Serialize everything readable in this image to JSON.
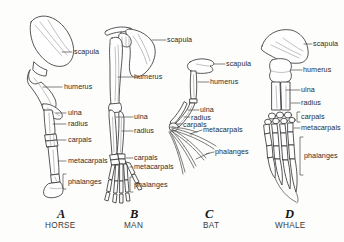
{
  "figure": {
    "background_color": "#fdfdfc",
    "ink_color": "#3a3a3a"
  },
  "panels": [
    {
      "letter": "A",
      "name": "HORSE",
      "labels": [
        {
          "key": "scapula",
          "text": "scapula"
        },
        {
          "key": "humerus",
          "text": "humerus"
        },
        {
          "key": "ulna",
          "text": "ulna"
        },
        {
          "key": "radius",
          "text": "radius"
        },
        {
          "key": "carpals",
          "text": "carpals"
        },
        {
          "key": "metacarpals",
          "text": "metacarpals"
        },
        {
          "key": "phalanges",
          "text": "phalanges"
        }
      ]
    },
    {
      "letter": "B",
      "name": "MAN",
      "labels": [
        {
          "key": "scapula",
          "text": "scapula"
        },
        {
          "key": "humerus",
          "text": "humerus"
        },
        {
          "key": "ulna",
          "text": "ulna"
        },
        {
          "key": "radius",
          "text": "radius"
        },
        {
          "key": "carpals",
          "text": "carpals"
        },
        {
          "key": "metacarpals",
          "text": "metacarpals"
        },
        {
          "key": "phalanges",
          "text": "phalanges"
        }
      ]
    },
    {
      "letter": "C",
      "name": "BAT",
      "labels": [
        {
          "key": "scapula",
          "text": "scapula"
        },
        {
          "key": "humerus",
          "text": "humerus"
        },
        {
          "key": "ulna",
          "text": "ulna"
        },
        {
          "key": "radius",
          "text": "radius"
        },
        {
          "key": "carpals",
          "text": "carpals"
        },
        {
          "key": "metacarpals",
          "text": "metacarpals"
        },
        {
          "key": "phalanges",
          "text": "phalanges"
        }
      ]
    },
    {
      "letter": "D",
      "name": "WHALE",
      "labels": [
        {
          "key": "scapula",
          "text": "scapula"
        },
        {
          "key": "humerus",
          "text": "humerus"
        },
        {
          "key": "ulna",
          "text": "ulna"
        },
        {
          "key": "radius",
          "text": "radius"
        },
        {
          "key": "carpals",
          "text": "carpals"
        },
        {
          "key": "metacarpals",
          "text": "metacarpals"
        },
        {
          "key": "phalanges",
          "text": "phalanges"
        }
      ]
    }
  ]
}
